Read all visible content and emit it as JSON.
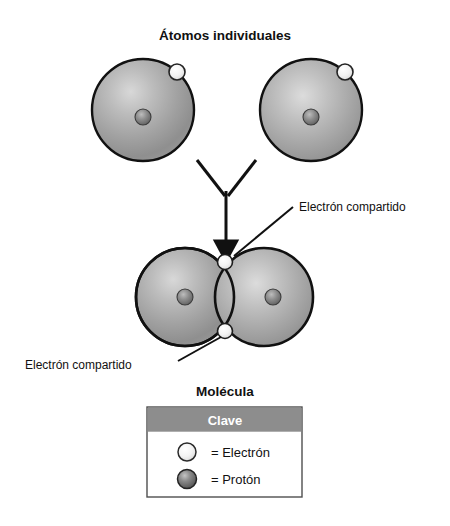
{
  "figure": {
    "background_color": "#ffffff",
    "title": "Átomos individuales",
    "bottom_title": "Molécula",
    "outline_color": "#111111"
  },
  "individual_atoms": {
    "heading": "Átomos individuales",
    "atoms": [
      {
        "name": "left-atom",
        "cx": 143,
        "cy": 110,
        "r": 51,
        "proton": {
          "cx": 143,
          "cy": 117,
          "r": 8
        },
        "electron": {
          "cx": 177,
          "cy": 72,
          "r": 8
        }
      },
      {
        "name": "right-atom",
        "cx": 311,
        "cy": 110,
        "r": 51,
        "proton": {
          "cx": 311,
          "cy": 117,
          "r": 8
        },
        "electron": {
          "cx": 345,
          "cy": 72,
          "r": 8
        }
      }
    ]
  },
  "arrow": {
    "name": "combine-arrow",
    "left_branch": {
      "x1": 197,
      "y1": 160,
      "x2": 224,
      "y2": 195
    },
    "right_branch": {
      "x1": 256,
      "y1": 160,
      "x2": 228,
      "y2": 195
    },
    "shaft": {
      "x1": 226,
      "y1": 192,
      "x2": 226,
      "y2": 240
    },
    "head_tip": {
      "x": 226,
      "y": 258
    }
  },
  "molecule": {
    "heading": "Molécula",
    "atoms": [
      {
        "name": "molecule-left-atom",
        "cx": 185,
        "cy": 297,
        "r": 49,
        "proton": {
          "cx": 185,
          "cy": 297,
          "r": 8
        }
      },
      {
        "name": "molecule-right-atom",
        "cx": 264,
        "cy": 297,
        "r": 49,
        "proton": {
          "cx": 273,
          "cy": 297,
          "r": 8
        }
      }
    ],
    "shared_electrons": [
      {
        "name": "shared-electron-top",
        "cx": 225,
        "cy": 262,
        "r": 7.5
      },
      {
        "name": "shared-electron-bottom",
        "cx": 225,
        "cy": 331,
        "r": 7.5
      }
    ]
  },
  "callouts": [
    {
      "name": "callout-top",
      "text": "Electrón compartido",
      "text_x": 299,
      "text_y": 212,
      "leader": {
        "x1": 294,
        "y1": 208,
        "x2": 234,
        "y2": 257
      }
    },
    {
      "name": "callout-bottom",
      "text": "Electrón compartido",
      "text_x": 28,
      "text_y": 370,
      "leader": {
        "x1": 180,
        "y1": 362,
        "x2": 222,
        "y2": 337
      }
    }
  ],
  "legend": {
    "title": "Clave",
    "header_bg": "#8d8d8d",
    "header_text_color": "#ffffff",
    "border_color": "#555555",
    "box": {
      "x": 147,
      "y": 407,
      "width": 155,
      "height": 90
    },
    "items": [
      {
        "name": "legend-electron",
        "swatch": "electron-sphere",
        "label": "= Electrón"
      },
      {
        "name": "legend-proton",
        "swatch": "proton-sphere",
        "label": "= Protón"
      }
    ]
  }
}
